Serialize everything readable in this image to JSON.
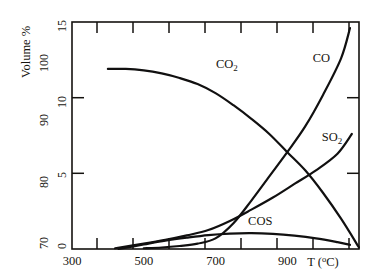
{
  "figure": {
    "background_color": "#ffffff",
    "ink_color": "#14120f"
  },
  "axes": {
    "y_title": "Volume %",
    "x_title_main": "T",
    "x_title_unit_open": " (",
    "x_title_degree": "o",
    "x_title_unit_c": "C)",
    "y_inner_ticks": [
      "0",
      "5",
      "10",
      "15"
    ],
    "y_outer_ticks": [
      "70",
      "80",
      "90",
      "100"
    ],
    "x_ticks": [
      "300",
      "500",
      "700",
      "900"
    ]
  },
  "chart_data": {
    "type": "line",
    "title": "",
    "xlabel": "T (°C)",
    "ylabel": "Volume %",
    "xlim": [
      300,
      1100
    ],
    "ylim": [
      0,
      15
    ],
    "y_secondary_lim": [
      70,
      105
    ],
    "y_secondary_ticks": [
      70,
      80,
      90,
      100
    ],
    "y_primary_ticks": [
      0,
      5,
      10,
      15
    ],
    "x_ticks_major": [
      300,
      500,
      700,
      900
    ],
    "x_ticks_minor": [
      400,
      600,
      800,
      1000
    ],
    "grid": false,
    "legend": "inline-annotations",
    "series": [
      {
        "name": "CO2",
        "label": "CO₂",
        "label_position": {
          "x": 740,
          "y": 12.2
        },
        "x": [
          400,
          450,
          500,
          550,
          600,
          650,
          700,
          750,
          800,
          850,
          900,
          950,
          1000,
          1050,
          1100
        ],
        "values": [
          11.9,
          11.9,
          11.8,
          11.6,
          11.3,
          10.9,
          10.3,
          9.5,
          8.6,
          7.6,
          6.4,
          5.2,
          3.7,
          2.0,
          0.1
        ]
      },
      {
        "name": "CO",
        "label": "CO",
        "label_position": {
          "x": 1010,
          "y": 12.6
        },
        "x": [
          500,
          550,
          600,
          650,
          700,
          750,
          800,
          850,
          900,
          950,
          1000,
          1050,
          1075
        ],
        "values": [
          0.05,
          0.1,
          0.2,
          0.35,
          0.7,
          1.7,
          3.2,
          4.8,
          6.4,
          8.1,
          10.2,
          12.6,
          14.6
        ]
      },
      {
        "name": "SO2",
        "label": "SO₂",
        "label_position": {
          "x": 1035,
          "y": 7.4
        },
        "x": [
          420,
          500,
          560,
          620,
          680,
          740,
          800,
          860,
          920,
          980,
          1040,
          1080
        ],
        "values": [
          0.05,
          0.35,
          0.6,
          0.9,
          1.25,
          1.85,
          2.6,
          3.4,
          4.3,
          5.2,
          6.3,
          7.6
        ]
      },
      {
        "name": "COS",
        "label": "COS",
        "label_position": {
          "x": 830,
          "y": 1.85
        },
        "x": [
          430,
          500,
          560,
          620,
          680,
          740,
          800,
          860,
          920,
          980,
          1040,
          1075
        ],
        "values": [
          0.0,
          0.3,
          0.55,
          0.75,
          0.92,
          1.02,
          1.05,
          1.0,
          0.88,
          0.7,
          0.45,
          0.28
        ]
      }
    ]
  }
}
